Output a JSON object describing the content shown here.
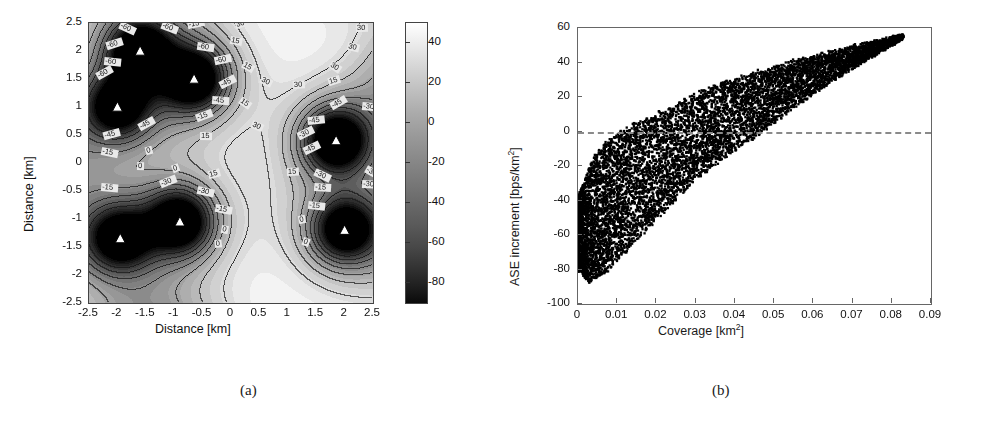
{
  "figure": {
    "subfigures": [
      {
        "id": "a",
        "caption": "(a)"
      },
      {
        "id": "b",
        "caption": "(b)"
      }
    ]
  },
  "chart_data": [
    {
      "type": "heatmap",
      "panel": "a",
      "title": "",
      "xlabel": "Distance [km]",
      "ylabel": "Distance [km]",
      "xlim": [
        -2.5,
        2.5
      ],
      "ylim": [
        -2.5,
        2.5
      ],
      "xticks": [
        "-2.5",
        "-2",
        "-1.5",
        "-1",
        "-0.5",
        "0",
        "0.5",
        "1",
        "1.5",
        "2",
        "2.5"
      ],
      "xtick_values": [
        -2.5,
        -2,
        -1.5,
        -1,
        -0.5,
        0,
        0.5,
        1,
        1.5,
        2,
        2.5
      ],
      "yticks": [
        "2.5",
        "2",
        "1.5",
        "1",
        "0.5",
        "0",
        "-0.5",
        "-1",
        "-1.5",
        "-2",
        "-2.5"
      ],
      "ytick_values": [
        2.5,
        2,
        1.5,
        1,
        0.5,
        0,
        -0.5,
        -1,
        -1.5,
        -2,
        -2.5
      ],
      "grid": false,
      "colorbar": {
        "min": -90,
        "max": 50,
        "ticks": [
          40,
          20,
          0,
          -20,
          -40,
          -60,
          -80
        ],
        "tick_labels": [
          "40",
          "20",
          "0",
          "-20",
          "-40",
          "-60",
          "-80"
        ],
        "colormap": "gray",
        "high_color": "#ffffff",
        "low_color": "#000000"
      },
      "contour_levels": [
        -60,
        -45,
        -30,
        -15,
        0,
        15,
        30,
        45
      ],
      "contour_labels": [
        "45",
        "30",
        "15",
        "0",
        "-15",
        "-30",
        "-45",
        "-60"
      ],
      "markers": {
        "symbol": "triangle",
        "fill": "#ffffff",
        "edge": "#000000",
        "label": "base-station",
        "points": [
          {
            "x": -1.6,
            "y": 2.0,
            "depth": -80
          },
          {
            "x": -0.65,
            "y": 1.5,
            "depth": -82
          },
          {
            "x": -2.0,
            "y": 1.0,
            "depth": -62
          },
          {
            "x": 1.85,
            "y": 0.4,
            "depth": -90
          },
          {
            "x": -0.9,
            "y": -1.05,
            "depth": -86
          },
          {
            "x": -1.95,
            "y": -1.35,
            "depth": -66
          },
          {
            "x": 2.0,
            "y": -1.2,
            "depth": -76
          }
        ]
      },
      "high_regions": [
        {
          "x": 0.85,
          "y": 1.85,
          "value": 48
        },
        {
          "x": 0.55,
          "y": 0.0,
          "value": 50
        },
        {
          "x": 0.6,
          "y": -1.95,
          "value": 47
        }
      ]
    },
    {
      "type": "scatter",
      "panel": "b",
      "title": "",
      "xlabel": "Coverage [km2]",
      "xlabel_base": "Coverage [km",
      "xlabel_sup": "2",
      "xlabel_tail": "]",
      "ylabel": "ASE increment [bps/km2]",
      "ylabel_base": "ASE increment [bps/km",
      "ylabel_sup": "2",
      "ylabel_tail": "]",
      "xlim": [
        0,
        0.09
      ],
      "ylim": [
        -100,
        60
      ],
      "xticks": [
        "0",
        "0.01",
        "0.02",
        "0.03",
        "0.04",
        "0.05",
        "0.06",
        "0.07",
        "0.08",
        "0.09"
      ],
      "xtick_values": [
        0,
        0.01,
        0.02,
        0.03,
        0.04,
        0.05,
        0.06,
        0.07,
        0.08,
        0.09
      ],
      "yticks": [
        "60",
        "40",
        "20",
        "0",
        "-20",
        "-40",
        "-60",
        "-80",
        "-100"
      ],
      "ytick_values": [
        60,
        40,
        20,
        0,
        -20,
        -40,
        -60,
        -80,
        -100
      ],
      "grid": false,
      "legend": "none",
      "marker_color": "#000000",
      "marker_size": 2,
      "n_points": 9000,
      "reference_line": {
        "value": 0,
        "style": "dashed",
        "color": "#8a8a8a",
        "orientation": "horizontal"
      },
      "cloud": {
        "x_range": [
          0.0,
          0.083
        ],
        "y_range": [
          -88,
          56
        ],
        "upper_envelope": [
          {
            "x": 0.0,
            "y": -38
          },
          {
            "x": 0.004,
            "y": -14
          },
          {
            "x": 0.008,
            "y": -4
          },
          {
            "x": 0.013,
            "y": 3
          },
          {
            "x": 0.018,
            "y": 8
          },
          {
            "x": 0.024,
            "y": 15
          },
          {
            "x": 0.03,
            "y": 22
          },
          {
            "x": 0.038,
            "y": 29
          },
          {
            "x": 0.046,
            "y": 35
          },
          {
            "x": 0.055,
            "y": 41
          },
          {
            "x": 0.064,
            "y": 46
          },
          {
            "x": 0.073,
            "y": 51
          },
          {
            "x": 0.083,
            "y": 56
          }
        ],
        "lower_envelope": [
          {
            "x": 0.0,
            "y": -80
          },
          {
            "x": 0.003,
            "y": -88
          },
          {
            "x": 0.008,
            "y": -80
          },
          {
            "x": 0.013,
            "y": -68
          },
          {
            "x": 0.018,
            "y": -56
          },
          {
            "x": 0.024,
            "y": -42
          },
          {
            "x": 0.03,
            "y": -28
          },
          {
            "x": 0.038,
            "y": -14
          },
          {
            "x": 0.046,
            "y": -2
          },
          {
            "x": 0.055,
            "y": 14
          },
          {
            "x": 0.064,
            "y": 28
          },
          {
            "x": 0.073,
            "y": 41
          },
          {
            "x": 0.083,
            "y": 54
          }
        ]
      }
    }
  ]
}
